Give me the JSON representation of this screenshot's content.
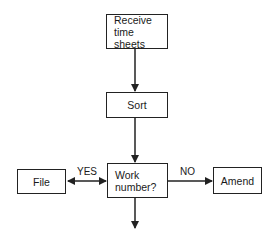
{
  "diagram": {
    "type": "flowchart",
    "nodes": {
      "receive": {
        "label": "Receive\ntime sheets"
      },
      "sort": {
        "label": "Sort"
      },
      "decision": {
        "label": "Work\nnumber?"
      },
      "file": {
        "label": "File"
      },
      "amend": {
        "label": "Amend"
      }
    },
    "edges": {
      "yes_label": "YES",
      "no_label": "NO"
    },
    "colors": {
      "stroke": "#222222",
      "background": "#ffffff"
    }
  }
}
